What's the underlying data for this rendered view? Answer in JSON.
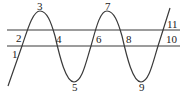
{
  "diagram": {
    "colors": {
      "stroke": "#3a3a3a",
      "label": "#222222",
      "background": "#ffffff"
    },
    "lines": [
      {
        "name": "upper-line",
        "y": 30
      },
      {
        "name": "lower-line",
        "y": 46
      }
    ],
    "labels": [
      {
        "id": "1",
        "text": "1",
        "x": 12,
        "y": 58
      },
      {
        "id": "2",
        "text": "2",
        "x": 16,
        "y": 42
      },
      {
        "id": "3",
        "text": "3",
        "x": 36,
        "y": 10
      },
      {
        "id": "4",
        "text": "4",
        "x": 56,
        "y": 42
      },
      {
        "id": "5",
        "text": "5",
        "x": 71,
        "y": 92
      },
      {
        "id": "6",
        "text": "6",
        "x": 97,
        "y": 42
      },
      {
        "id": "7",
        "text": "7",
        "x": 104,
        "y": 10
      },
      {
        "id": "8",
        "text": "8",
        "x": 125,
        "y": 42
      },
      {
        "id": "9",
        "text": "9",
        "x": 138,
        "y": 92
      },
      {
        "id": "10",
        "text": "10",
        "x": 166,
        "y": 42
      },
      {
        "id": "11",
        "text": "11",
        "x": 166,
        "y": 27
      }
    ]
  }
}
